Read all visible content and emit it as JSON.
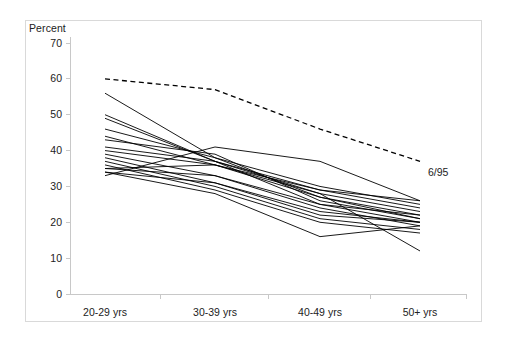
{
  "chart_data": {
    "type": "line",
    "title": "",
    "subtitle": "",
    "xlabel": "",
    "ylabel": "Percent",
    "categories": [
      "20-29 yrs",
      "30-39 yrs",
      "40-49 yrs",
      "50+ yrs"
    ],
    "ylim": [
      0,
      70
    ],
    "yticks": [
      0,
      10,
      20,
      30,
      40,
      50,
      60,
      70
    ],
    "ytick_labels": [
      "0",
      "10",
      "20",
      "30",
      "40",
      "50",
      "60",
      "70"
    ],
    "grid": false,
    "legend": "none",
    "annotations": [
      {
        "text": "6/95",
        "category": "50+ yrs",
        "value": 37,
        "attached_series": "6/95"
      }
    ],
    "series": [
      {
        "name": "6/95",
        "style": "dashed",
        "color": "#000000",
        "values": [
          60,
          57,
          46,
          37
        ]
      },
      {
        "name": "line-01",
        "style": "solid",
        "color": "#000000",
        "values": [
          56,
          38,
          27,
          21
        ]
      },
      {
        "name": "line-02",
        "style": "solid",
        "color": "#000000",
        "values": [
          50,
          37,
          29,
          24
        ]
      },
      {
        "name": "line-03",
        "style": "solid",
        "color": "#000000",
        "values": [
          49,
          37,
          28,
          23
        ]
      },
      {
        "name": "line-04",
        "style": "solid",
        "color": "#000000",
        "values": [
          46,
          38,
          30,
          25
        ]
      },
      {
        "name": "line-05",
        "style": "solid",
        "color": "#000000",
        "values": [
          44,
          36,
          27,
          22
        ]
      },
      {
        "name": "line-06",
        "style": "solid",
        "color": "#000000",
        "values": [
          43,
          39,
          26,
          21
        ]
      },
      {
        "name": "line-07",
        "style": "solid",
        "color": "#000000",
        "values": [
          41,
          37,
          25,
          20
        ]
      },
      {
        "name": "line-08",
        "style": "solid",
        "color": "#000000",
        "values": [
          40,
          36,
          29,
          26
        ]
      },
      {
        "name": "line-09",
        "style": "solid",
        "color": "#000000",
        "values": [
          39,
          33,
          24,
          19
        ]
      },
      {
        "name": "line-10",
        "style": "solid",
        "color": "#000000",
        "values": [
          38,
          31,
          22,
          20
        ]
      },
      {
        "name": "line-11",
        "style": "solid",
        "color": "#000000",
        "values": [
          37,
          30,
          21,
          18
        ]
      },
      {
        "name": "line-12",
        "style": "solid",
        "color": "#000000",
        "values": [
          36,
          29,
          20,
          17
        ]
      },
      {
        "name": "line-13",
        "style": "solid",
        "color": "#000000",
        "values": [
          35,
          33,
          25,
          22
        ]
      },
      {
        "name": "line-14",
        "style": "solid",
        "color": "#000000",
        "values": [
          34,
          31,
          23,
          20
        ]
      },
      {
        "name": "line-15",
        "style": "solid",
        "color": "#000000",
        "values": [
          34,
          28,
          16,
          19
        ]
      },
      {
        "name": "line-16",
        "style": "solid",
        "color": "#000000",
        "values": [
          33,
          41,
          37,
          26
        ]
      },
      {
        "name": "line-17",
        "style": "solid",
        "color": "#000000",
        "values": [
          35,
          36,
          28,
          12
        ]
      }
    ],
    "geometry": {
      "plot_left_px": 70,
      "plot_right_px": 466,
      "y_zero_px": 294,
      "y_top_px": 43,
      "y_top_value": 70,
      "category_x_px": [
        105,
        215,
        320,
        420
      ]
    },
    "style": {
      "frame_color": "#d9d9d9",
      "axis_color": "#c8c8c8",
      "line_color": "#000000",
      "text_color": "#222222",
      "background": "#ffffff"
    }
  }
}
